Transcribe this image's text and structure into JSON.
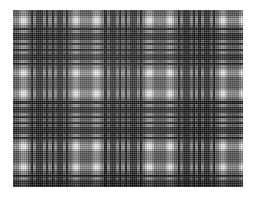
{
  "image": {
    "title": "Grayscale plaid tartan fabric swatch",
    "background_color": "#ffffff",
    "width": 255,
    "height": 200
  },
  "swatch": {
    "label": "plaid-fabric-swatch",
    "left": 13,
    "top": 10,
    "width": 230,
    "height": 177,
    "base_color": "#8e8e8e",
    "weave": "plain-weave-crosshatch"
  },
  "palette": {
    "black": "#1d1d1d",
    "near_black": "#2b2b2b",
    "dark_gray": "#4a4a4a",
    "mid_dark_gray": "#6e6e6e",
    "mid_gray": "#8e8e8e",
    "light_gray": "#b4b4b4",
    "pale_gray": "#d2d2d2",
    "white": "#f2f2f2"
  },
  "pattern": {
    "type": "tartan-plaid",
    "repeat_px": 38.5,
    "symmetry": "mirrored-sett",
    "warp_sequence": [
      {
        "color": "#8e8e8e",
        "width": 6.0
      },
      {
        "color": "#c9c9c9",
        "width": 2.0
      },
      {
        "color": "#f2f2f2",
        "width": 4.5
      },
      {
        "color": "#c9c9c9",
        "width": 2.0
      },
      {
        "color": "#8e8e8e",
        "width": 3.5
      },
      {
        "color": "#1d1d1d",
        "width": 2.2
      },
      {
        "color": "#8e8e8e",
        "width": 3.0
      },
      {
        "color": "#3a3a3a",
        "width": 6.5
      },
      {
        "color": "#8e8e8e",
        "width": 3.0
      },
      {
        "color": "#1d1d1d",
        "width": 2.2
      },
      {
        "color": "#8e8e8e",
        "width": 3.6
      }
    ],
    "weft_sequence": [
      {
        "color": "#8e8e8e",
        "width": 6.0
      },
      {
        "color": "#c9c9c9",
        "width": 2.0
      },
      {
        "color": "#f2f2f2",
        "width": 4.5
      },
      {
        "color": "#c9c9c9",
        "width": 2.0
      },
      {
        "color": "#8e8e8e",
        "width": 3.5
      },
      {
        "color": "#1d1d1d",
        "width": 2.2
      },
      {
        "color": "#8e8e8e",
        "width": 3.0
      },
      {
        "color": "#3a3a3a",
        "width": 6.5
      },
      {
        "color": "#8e8e8e",
        "width": 3.0
      },
      {
        "color": "#1d1d1d",
        "width": 2.2
      },
      {
        "color": "#8e8e8e",
        "width": 3.6
      }
    ]
  }
}
